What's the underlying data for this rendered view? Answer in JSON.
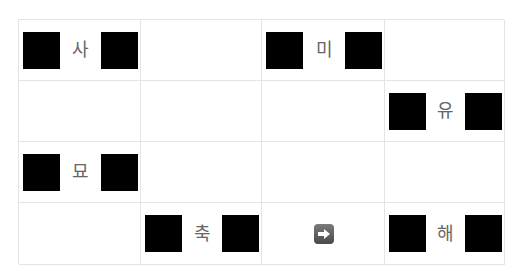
{
  "grid": {
    "rows": 4,
    "cols": 4,
    "cells": [
      {
        "row": 0,
        "col": 0,
        "char": "사",
        "blocks": true
      },
      {
        "row": 0,
        "col": 1,
        "char": "",
        "blocks": false
      },
      {
        "row": 0,
        "col": 2,
        "char": "미",
        "blocks": true
      },
      {
        "row": 0,
        "col": 3,
        "char": "",
        "blocks": false
      },
      {
        "row": 1,
        "col": 0,
        "char": "",
        "blocks": false
      },
      {
        "row": 1,
        "col": 1,
        "char": "",
        "blocks": false
      },
      {
        "row": 1,
        "col": 2,
        "char": "",
        "blocks": false
      },
      {
        "row": 1,
        "col": 3,
        "char": "유",
        "blocks": true
      },
      {
        "row": 2,
        "col": 0,
        "char": "묘",
        "blocks": true
      },
      {
        "row": 2,
        "col": 1,
        "char": "",
        "blocks": false
      },
      {
        "row": 2,
        "col": 2,
        "char": "",
        "blocks": false
      },
      {
        "row": 2,
        "col": 3,
        "char": "",
        "blocks": false
      },
      {
        "row": 3,
        "col": 0,
        "char": "",
        "blocks": false
      },
      {
        "row": 3,
        "col": 1,
        "char": "축",
        "blocks": true
      },
      {
        "row": 3,
        "col": 2,
        "char": "",
        "blocks": false,
        "icon": "right-arrow-icon"
      },
      {
        "row": 3,
        "col": 3,
        "char": "해",
        "blocks": true
      }
    ]
  },
  "colors": {
    "grid_line": "#e4e4e4",
    "block": "#000000",
    "char": "#666666",
    "arrow_bg": "#5a5a5a"
  }
}
